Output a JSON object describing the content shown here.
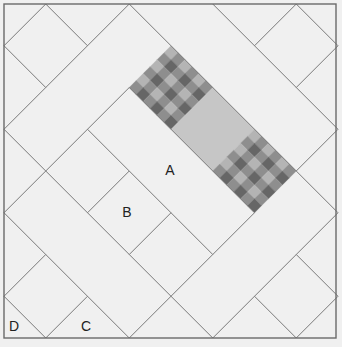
{
  "diagram": {
    "type": "diagonal-tile-layout",
    "grid": {
      "origin_px": [
        4,
        4
      ],
      "unit_px": 41.75,
      "size_units": 8
    },
    "colors": {
      "background": "#f0f0f0",
      "line": "#7a7a7a",
      "border": "#6a6a6a",
      "plain_tile": "#c6c6c6",
      "check_dark": "#666666",
      "check_mid": "#8e8e8e",
      "check_light": "#b4b4b4",
      "label": "#222222"
    },
    "segments": [
      [
        [
          1,
          0
        ],
        [
          0,
          1
        ]
      ],
      [
        [
          1,
          0
        ],
        [
          2,
          1
        ]
      ],
      [
        [
          3,
          0
        ],
        [
          0,
          3
        ]
      ],
      [
        [
          0,
          1
        ],
        [
          1,
          2
        ]
      ],
      [
        [
          3,
          0
        ],
        [
          8,
          5
        ]
      ],
      [
        [
          5,
          0
        ],
        [
          8,
          3
        ]
      ],
      [
        [
          7,
          0
        ],
        [
          6,
          1
        ]
      ],
      [
        [
          7,
          0
        ],
        [
          8,
          1
        ]
      ],
      [
        [
          8,
          1
        ],
        [
          7,
          2
        ]
      ],
      [
        [
          8,
          3
        ],
        [
          7,
          4
        ]
      ],
      [
        [
          3,
          2
        ],
        [
          0,
          5
        ]
      ],
      [
        [
          3,
          2
        ],
        [
          6,
          5
        ]
      ],
      [
        [
          6,
          5
        ],
        [
          3,
          8
        ]
      ],
      [
        [
          0,
          3
        ],
        [
          5,
          8
        ]
      ],
      [
        [
          2,
          3
        ],
        [
          5,
          6
        ]
      ],
      [
        [
          2,
          5
        ],
        [
          3,
          4
        ]
      ],
      [
        [
          4,
          5
        ],
        [
          3,
          6
        ]
      ],
      [
        [
          0,
          5
        ],
        [
          3,
          8
        ]
      ],
      [
        [
          1,
          6
        ],
        [
          0,
          7
        ]
      ],
      [
        [
          0,
          7
        ],
        [
          1,
          8
        ]
      ],
      [
        [
          2,
          7
        ],
        [
          1,
          8
        ]
      ],
      [
        [
          8,
          5
        ],
        [
          5,
          8
        ]
      ],
      [
        [
          7,
          6
        ],
        [
          8,
          7
        ]
      ],
      [
        [
          8,
          7
        ],
        [
          7,
          8
        ]
      ],
      [
        [
          6,
          7
        ],
        [
          7,
          8
        ]
      ]
    ],
    "shaded_tiles": [
      {
        "name": "checkered-tile-1",
        "fill": "checker",
        "corners": [
          [
            4,
            1
          ],
          [
            5,
            2
          ],
          [
            4,
            3
          ],
          [
            3,
            2
          ]
        ]
      },
      {
        "name": "gray-tile",
        "fill": "plain",
        "corners": [
          [
            5,
            2
          ],
          [
            6,
            3
          ],
          [
            5,
            4
          ],
          [
            4,
            3
          ]
        ]
      },
      {
        "name": "checkered-tile-2",
        "fill": "checker",
        "corners": [
          [
            6,
            3
          ],
          [
            7,
            4
          ],
          [
            6,
            5
          ],
          [
            5,
            4
          ]
        ]
      }
    ],
    "checker_cells": 6,
    "labels": [
      {
        "text": "A",
        "x": 170,
        "y": 175
      },
      {
        "text": "B",
        "x": 127,
        "y": 217
      },
      {
        "text": "C",
        "x": 86,
        "y": 331
      },
      {
        "text": "D",
        "x": 14,
        "y": 331
      }
    ]
  }
}
